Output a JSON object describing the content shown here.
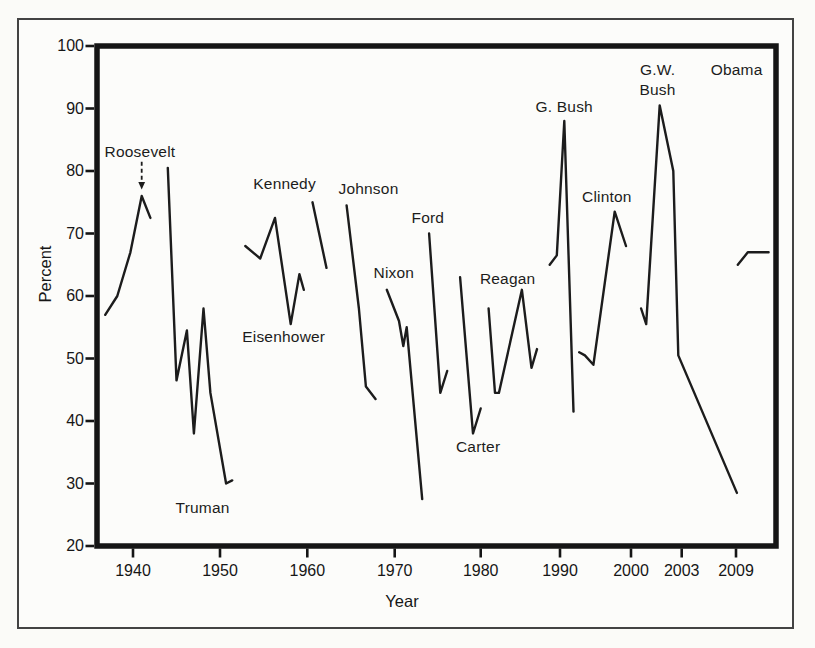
{
  "figure": {
    "description_label": "",
    "border_color": "#434343",
    "background": "#fbfbf8"
  },
  "chart_data": {
    "type": "line",
    "title": "",
    "xlabel": "Year",
    "ylabel": "Percent",
    "ylim": [
      20,
      100
    ],
    "yticks": [
      100,
      90,
      80,
      70,
      60,
      50,
      40,
      30,
      20
    ],
    "xticks": [
      1940,
      1950,
      1960,
      1970,
      1980,
      1990,
      2000,
      2003,
      2009
    ],
    "grid": false,
    "legend": "none",
    "line_color": "#1c1c1c",
    "series": [
      {
        "name": "Roosevelt",
        "label": "Roosevelt",
        "label_pos": {
          "year": 1940.8,
          "percent": 83.0
        },
        "points": [
          [
            1936.8,
            57
          ],
          [
            1938.2,
            60
          ],
          [
            1939.7,
            67
          ],
          [
            1941,
            76
          ],
          [
            1942,
            72.5
          ]
        ]
      },
      {
        "name": "Truman",
        "label": "Truman",
        "label_pos": {
          "year": 1948.0,
          "percent": 26.1
        },
        "points": [
          [
            1944,
            80.5
          ],
          [
            1945,
            46.5
          ],
          [
            1946.2,
            54.5
          ],
          [
            1947,
            38
          ],
          [
            1948.1,
            58
          ],
          [
            1948.9,
            44.5
          ],
          [
            1950.7,
            30
          ],
          [
            1951.4,
            30.5
          ]
        ]
      },
      {
        "name": "Eisenhower",
        "label": "Eisenhower",
        "label_pos": {
          "year": 1957.3,
          "percent": 53.4
        },
        "points": [
          [
            1952.9,
            68
          ],
          [
            1954.6,
            66
          ],
          [
            1956.3,
            72.5
          ],
          [
            1958.1,
            55.5
          ],
          [
            1959.1,
            63.5
          ],
          [
            1959.6,
            61
          ]
        ]
      },
      {
        "name": "Kennedy",
        "label": "Kennedy",
        "label_pos": {
          "year": 1957.4,
          "percent": 77.9
        },
        "points": [
          [
            1960.6,
            75
          ],
          [
            1962.2,
            64.5
          ]
        ]
      },
      {
        "name": "Johnson",
        "label": "Johnson",
        "label_pos": {
          "year": 1967.0,
          "percent": 77.1
        },
        "points": [
          [
            1964.5,
            74.5
          ],
          [
            1965.9,
            58
          ],
          [
            1966.7,
            45.5
          ],
          [
            1967.8,
            43.5
          ]
        ]
      },
      {
        "name": "Nixon",
        "label": "Nixon",
        "label_pos": {
          "year": 1969.9,
          "percent": 63.7
        },
        "points": [
          [
            1969.1,
            61
          ],
          [
            1970.5,
            56
          ],
          [
            1971,
            52
          ],
          [
            1971.4,
            55
          ],
          [
            1973.2,
            27.5
          ]
        ]
      },
      {
        "name": "Ford",
        "label": "Ford",
        "label_pos": {
          "year": 1973.85,
          "percent": 72.5
        },
        "points": [
          [
            1974,
            70
          ],
          [
            1975.3,
            44.5
          ],
          [
            1976.1,
            48
          ]
        ]
      },
      {
        "name": "Carter",
        "label": "Carter",
        "label_pos": {
          "year": 1979.7,
          "percent": 35.8
        },
        "points": [
          [
            1977.6,
            63
          ],
          [
            1979.1,
            38
          ],
          [
            1980,
            42
          ]
        ]
      },
      {
        "name": "Reagan",
        "label": "Reagan",
        "label_pos": {
          "year": 1983.4,
          "percent": 62.7
        },
        "points": [
          [
            1981,
            58
          ],
          [
            1981.8,
            44.5
          ],
          [
            1982.3,
            44.5
          ],
          [
            1985.2,
            61
          ],
          [
            1986.4,
            48.5
          ],
          [
            1987.1,
            51.5
          ]
        ]
      },
      {
        "name": "G. Bush",
        "label": "G. Bush",
        "label_pos": {
          "year": 1990.6,
          "percent": 90.2
        },
        "points": [
          [
            1988.7,
            65
          ],
          [
            1989.6,
            66.5
          ],
          [
            1990.6,
            88
          ],
          [
            1991.9,
            41.5
          ]
        ]
      },
      {
        "name": "Clinton",
        "label": "Clinton",
        "label_pos": {
          "year": 1996.6,
          "percent": 75.8
        },
        "points": [
          [
            1992.7,
            51
          ],
          [
            1993.5,
            50.5
          ],
          [
            1994.7,
            49
          ],
          [
            1997.7,
            73.5
          ],
          [
            1999.3,
            68
          ]
        ]
      },
      {
        "name": "G.W. Bush",
        "label": "G.W.\nBush",
        "label_pos": {
          "year": 2001.57,
          "percent": 94.7
        },
        "points": [
          [
            2000.6,
            58
          ],
          [
            2000.9,
            55.5
          ],
          [
            2001.7,
            90.5
          ],
          [
            2002.5,
            80
          ],
          [
            2002.8,
            50.5
          ],
          [
            2009.1,
            28.5
          ]
        ]
      },
      {
        "name": "Obama",
        "label": "Obama",
        "label_pos": {
          "year": 2009.07,
          "percent": 96.2
        },
        "points": [
          [
            2009.2,
            65
          ],
          [
            2010.3,
            67
          ],
          [
            2012.6,
            67
          ]
        ]
      }
    ],
    "annotations": [
      {
        "name": "roosevelt-arrow",
        "type": "dashed-down-arrow",
        "year": 1941,
        "from_percent": 81.5,
        "to_percent": 77.2
      }
    ]
  }
}
